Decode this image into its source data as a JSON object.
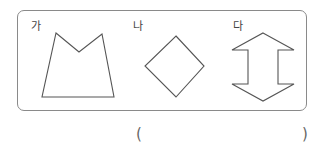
{
  "figures": [
    {
      "label": "가",
      "shape": "irregular-pentagon",
      "points": "56,33 79,52 102,34 114,97 42,97"
    },
    {
      "label": "나",
      "shape": "diamond",
      "points": "176,36 204,66 176,97 145,66"
    },
    {
      "label": "다",
      "shape": "double-arrow",
      "points": "263,33 294,50 278,50 278,84 294,84 263,101 232,84 248,84 248,50 232,50"
    }
  ],
  "answer": {
    "open": "(",
    "close": ")",
    "value": ""
  },
  "colors": {
    "stroke": "#555555",
    "frame": "#8a8a8a"
  }
}
